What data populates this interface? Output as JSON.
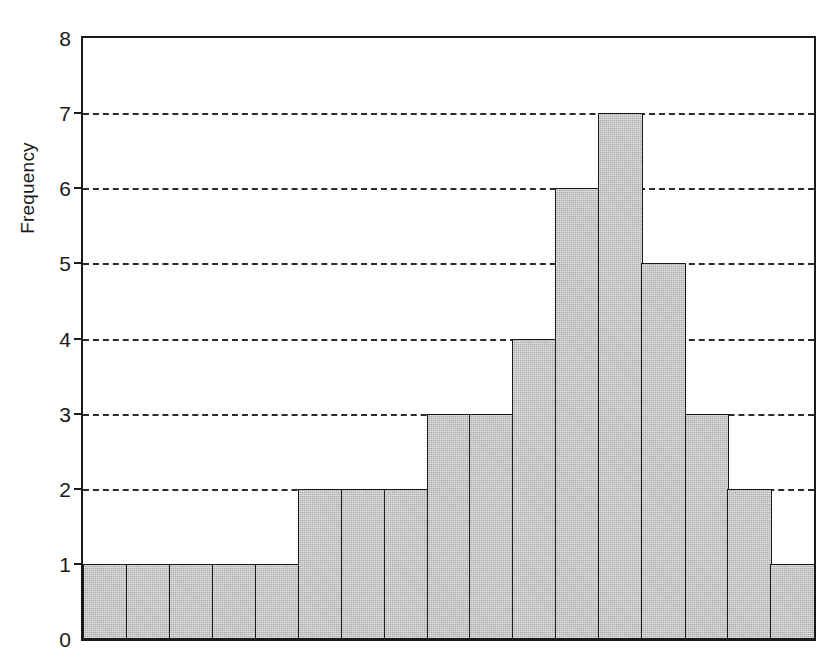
{
  "chart_data": {
    "type": "bar",
    "title": "",
    "subtitle": "",
    "xlabel": "",
    "ylabel": "Frequency",
    "ylim": [
      0,
      8
    ],
    "ytick_labels": [
      "0",
      "1",
      "2",
      "3",
      "4",
      "5",
      "6",
      "7",
      "8"
    ],
    "ytick_values": [
      0,
      1,
      2,
      3,
      4,
      5,
      6,
      7,
      8
    ],
    "xtick_labels": [],
    "grid": "horizontal-dashed",
    "legend": "none",
    "bar_count": 17,
    "categories": [
      "1",
      "2",
      "3",
      "4",
      "5",
      "6",
      "7",
      "8",
      "9",
      "10",
      "11",
      "12",
      "13",
      "14",
      "15",
      "16",
      "17"
    ],
    "values": [
      1,
      1,
      1,
      1,
      1,
      2,
      2,
      2,
      3,
      3,
      4,
      6,
      7,
      5,
      3,
      2,
      1
    ],
    "total_frequency": 36,
    "annotations": []
  },
  "style": {
    "bar_fill_color": "#b0b0b0",
    "bar_edge_color": "#1a1a1a",
    "axis_color": "#1a1a1a",
    "grid_color": "#2b2b2b",
    "background_color": "#ffffff"
  },
  "axes": {
    "ylabel": "Frequency"
  }
}
